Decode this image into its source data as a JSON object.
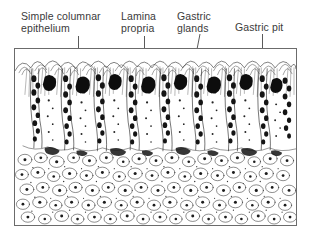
{
  "figure": {
    "frame": {
      "border_color": "#6b6b6b",
      "background": "#ffffff"
    },
    "ink_color": "#1a1a1a",
    "text_color": "#3a3a3a",
    "leader_color": "#5a5a5a"
  },
  "labels": [
    {
      "id": "simple-columnar-epithelium",
      "text": "Simple columnar\nepithelium",
      "lines": [
        "Simple columnar",
        "epithelium"
      ],
      "leader": {
        "type": "vertical",
        "x": 78,
        "y_start": 36,
        "y_end": 66
      }
    },
    {
      "id": "lamina-propria",
      "text": "Lamina\npropria",
      "lines": [
        "Lamina",
        "propria"
      ],
      "leader": {
        "type": "vertical",
        "x": 144,
        "y_start": 36,
        "y_end": 66
      }
    },
    {
      "id": "gastric-glands",
      "text": "Gastric\nglands",
      "lines": [
        "Gastric",
        "glands"
      ],
      "leader": {
        "type": "diagonal",
        "x_start": 200,
        "y_start": 34,
        "x_end": 178,
        "y_end": 146
      }
    },
    {
      "id": "gastric-pit",
      "text": "Gastric pit",
      "lines": [
        "Gastric pit"
      ],
      "leader": {
        "type": "vertical",
        "x": 262,
        "y_start": 34,
        "y_end": 101
      }
    }
  ],
  "regions": [
    {
      "id": "mucosal-surface",
      "description": "Luminal surface with gastric pits lined by simple columnar epithelium"
    },
    {
      "id": "gastric-glands-zone",
      "description": "Tubular gastric glands extending downward from the pits"
    },
    {
      "id": "lamina-propria-zone",
      "description": "Connective tissue with loose rounded cells between and beneath the glands"
    }
  ]
}
